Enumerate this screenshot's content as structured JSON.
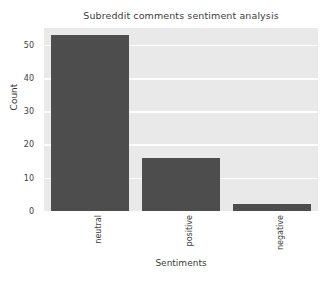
{
  "chart_data": {
    "type": "bar",
    "title": "Subreddit comments sentiment analysis",
    "xlabel": "Sentiments",
    "ylabel": "Count",
    "categories": [
      "neutral",
      "positive",
      "negative"
    ],
    "values": [
      53,
      16,
      2
    ],
    "ylim": [
      0,
      55
    ],
    "yticks": [
      0,
      10,
      20,
      30,
      40,
      50
    ],
    "ytick_labels": [
      "0",
      "10",
      "20",
      "30",
      "40",
      "50"
    ],
    "grid": "horizontal",
    "legend": "none",
    "xtick_rotation": 90,
    "style": {
      "bar_color": "#4d4d4d",
      "plot_background": "#e9e9e9",
      "gridline_color": "#fdfdfd",
      "figure_background": "#ffffff",
      "text_color": "#3c3c3c"
    }
  }
}
